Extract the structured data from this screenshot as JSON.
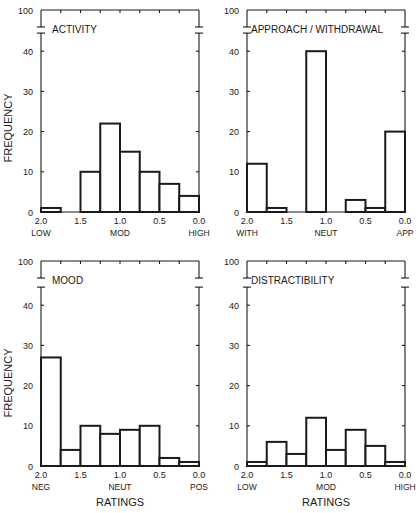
{
  "figure": {
    "y_axis_label": "FREQUENCY",
    "x_axis_label": "RATINGS",
    "y_ticks": [
      0,
      10,
      20,
      30,
      40
    ],
    "y_top_label": "100",
    "x_ticks": [
      "2.0",
      "1.5",
      "1.0",
      "0.5",
      "0.0"
    ]
  },
  "chart_data": [
    {
      "type": "bar",
      "title": "ACTIVITY",
      "xlabel": "",
      "ylabel": "FREQUENCY",
      "x_tick_labels": [
        "2.0",
        "1.5",
        "1.0",
        "0.5",
        "0.0"
      ],
      "x_anchor_labels": [
        "LOW",
        "MOD",
        "HIGH"
      ],
      "bin_edges": [
        2.0,
        1.75,
        1.5,
        1.25,
        1.0,
        0.75,
        0.5,
        0.25,
        0.0
      ],
      "values": [
        1,
        0,
        10,
        22,
        15,
        10,
        7,
        4
      ],
      "ylim": [
        0,
        100
      ],
      "y_axis_break": [
        45,
        95
      ]
    },
    {
      "type": "bar",
      "title": "APPROACH / WITHDRAWAL",
      "xlabel": "",
      "ylabel": "",
      "x_tick_labels": [
        "2.0",
        "1.5",
        "1.0",
        "0.5",
        "0.0"
      ],
      "x_anchor_labels": [
        "WITH",
        "NEUT",
        "APP"
      ],
      "bin_edges": [
        2.0,
        1.75,
        1.5,
        1.25,
        1.0,
        0.75,
        0.5,
        0.25,
        0.0
      ],
      "values": [
        12,
        1,
        0,
        40,
        0,
        3,
        1,
        20
      ],
      "ylim": [
        0,
        100
      ],
      "y_axis_break": [
        45,
        95
      ]
    },
    {
      "type": "bar",
      "title": "MOOD",
      "xlabel": "RATINGS",
      "ylabel": "FREQUENCY",
      "x_tick_labels": [
        "2.0",
        "1.5",
        "1.0",
        "0.5",
        "0.0"
      ],
      "x_anchor_labels": [
        "NEG",
        "NEUT",
        "POS"
      ],
      "bin_edges": [
        2.0,
        1.75,
        1.5,
        1.25,
        1.0,
        0.75,
        0.5,
        0.25,
        0.0
      ],
      "values": [
        27,
        4,
        10,
        8,
        9,
        10,
        2,
        1
      ],
      "ylim": [
        0,
        100
      ],
      "y_axis_break": [
        45,
        95
      ]
    },
    {
      "type": "bar",
      "title": "DISTRACTIBILITY",
      "xlabel": "RATINGS",
      "ylabel": "",
      "x_tick_labels": [
        "2.0",
        "1.5",
        "1.0",
        "0.5",
        "0.0"
      ],
      "x_anchor_labels": [
        "LOW",
        "MOD",
        "HIGH"
      ],
      "bin_edges": [
        2.0,
        1.75,
        1.5,
        1.25,
        1.0,
        0.75,
        0.5,
        0.25,
        0.0
      ],
      "values": [
        1,
        6,
        3,
        12,
        4,
        9,
        5,
        1
      ],
      "ylim": [
        0,
        100
      ],
      "y_axis_break": [
        45,
        95
      ]
    }
  ]
}
